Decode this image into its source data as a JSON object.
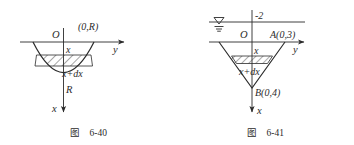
{
  "page": {
    "background": "#ffffff",
    "ink": "#2b2b2b"
  },
  "figures": [
    {
      "id": "fig-6-40",
      "caption_cjk": "图",
      "caption_number": "6-40",
      "description": "Parabolic bowl vessel cross-section with axes and hatched differential strip",
      "axes": {
        "origin_label": "O",
        "horizontal_axis_label": "y",
        "vertical_axis_label": "x",
        "vertical_direction": "down",
        "horizontal_direction": "right"
      },
      "labels": {
        "rim_point": "(0,R)",
        "strip_top": "x",
        "strip_bottom": "x+dx",
        "depth": "R"
      },
      "shape": "parabola-opening-upward",
      "hatching": "diagonal-45"
    },
    {
      "id": "fig-6-41",
      "caption_cjk": "图",
      "caption_number": "6-41",
      "description": "V-shaped (conical) vessel cross-section below a water surface line with hatched differential strip",
      "axes": {
        "origin_label": "O",
        "horizontal_axis_label": "y",
        "vertical_axis_label": "x",
        "vertical_direction": "down",
        "horizontal_direction": "right"
      },
      "labels": {
        "water_level_value": "-2",
        "water_surface_symbol": "water-level-triangle",
        "point_a": "A(0,3)",
        "point_b": "B(0,4)",
        "strip_top": "x",
        "strip_bottom": "x+dx"
      },
      "shape": "v-cone-opening-upward",
      "hatching": "diagonal-45"
    }
  ]
}
